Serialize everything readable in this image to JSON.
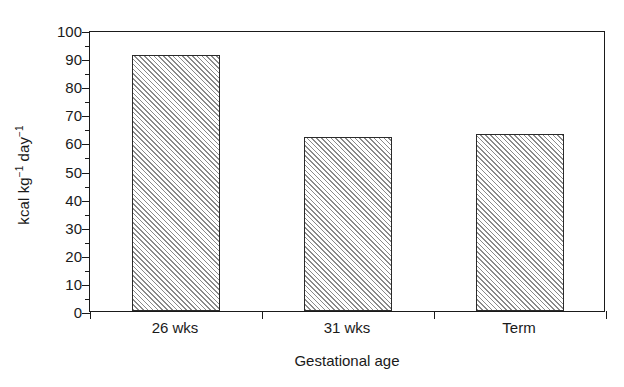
{
  "chart_data": {
    "type": "bar",
    "title": "",
    "subtitle": "",
    "categories": [
      "26 wks",
      "31 wks",
      "Term"
    ],
    "values": [
      91,
      62,
      63
    ],
    "xlabel": "Gestational age",
    "ylabel": "kcal kg⁻¹ day⁻¹",
    "ylabel_parts": {
      "prefix": "kcal kg",
      "sup1": "−1",
      "mid": " day",
      "sup2": "−1"
    },
    "ylim": [
      0,
      100
    ],
    "yticks": [
      0,
      10,
      20,
      30,
      40,
      50,
      60,
      70,
      80,
      90,
      100
    ],
    "ytick_labels": [
      "0",
      "10",
      "20",
      "30",
      "40",
      "50",
      "60",
      "70",
      "80",
      "90",
      "100"
    ],
    "yminor_ticks": [
      5,
      15,
      25,
      35,
      45,
      55,
      65,
      75,
      85,
      95
    ],
    "grid": false,
    "legend": null,
    "legend_position": "none",
    "bar_fill": "diagonal-hatch",
    "bar_edge_color": "#2a2a2a",
    "hatch_color": "#8a8a8a",
    "background_color": "#ffffff",
    "axis_color": "#1a1a1a"
  }
}
